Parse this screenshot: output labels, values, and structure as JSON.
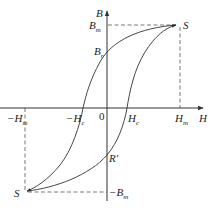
{
  "diagram": {
    "colors": {
      "line": "#333333",
      "dashed": "#555555",
      "text": "#222222",
      "background": "#ffffff"
    },
    "axes": {
      "x": {
        "label": "H",
        "origin_label": "0"
      },
      "y": {
        "label": "B"
      }
    },
    "labels": {
      "Bm": {
        "main": "B",
        "sub": "m"
      },
      "Br": {
        "main": "B",
        "sub": "r"
      },
      "neg_Bm": {
        "prefix": "−",
        "main": "B",
        "sub": "m"
      },
      "Hm": {
        "main": "H",
        "sub": "m"
      },
      "neg_Hm": {
        "prefix": "−",
        "main": "H",
        "sub": "m"
      },
      "Hc": {
        "main": "H",
        "sub": "c"
      },
      "neg_Hc": {
        "prefix": "−",
        "main": "H",
        "sub": "c"
      },
      "S_top": "S",
      "S_bottom": "S",
      "R_prime": "R′",
      "origin": "0",
      "H_axis": "H",
      "B_axis": "B"
    }
  }
}
